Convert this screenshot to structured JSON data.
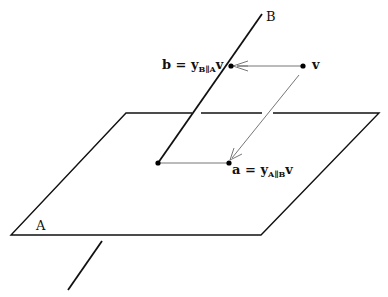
{
  "diagram": {
    "labels": {
      "line_B": "B",
      "plane_A": "A",
      "vector_v": "v",
      "b_lhs": "b = ",
      "b_y": "y",
      "b_sub": "B∥A",
      "b_v": "v",
      "a_lhs": "a = ",
      "a_y": "y",
      "a_sub": "A∥B",
      "a_v": "v"
    },
    "colors": {
      "line": "#111111",
      "thin_line": "#555555",
      "point": "#000000"
    },
    "geometry": {
      "plane_A": [
        [
          126,
          113
        ],
        [
          379,
          113
        ],
        [
          261,
          235
        ],
        [
          11,
          235
        ]
      ],
      "line_B_upper": [
        [
          262,
          14
        ],
        [
          158,
          163
        ]
      ],
      "line_B_lower": [
        [
          102,
          241
        ],
        [
          68,
          290
        ]
      ],
      "point_v": [
        303,
        66
      ],
      "point_b": [
        231,
        66
      ],
      "point_a": [
        229,
        163
      ],
      "point_origin": [
        158,
        163
      ]
    }
  }
}
